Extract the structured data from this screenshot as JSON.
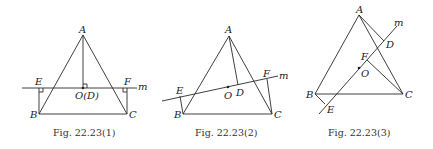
{
  "figures": [
    {
      "caption": "Fig.  22.23(1)",
      "labels": {
        "A": "A",
        "B": "B",
        "C": "C",
        "E": "E",
        "F": "F",
        "OD": "O(D)",
        "m": "m"
      }
    },
    {
      "caption": "Fig.  22.23(2)",
      "labels": {
        "A": "A",
        "B": "B",
        "C": "C",
        "D": "D",
        "E": "E",
        "F": "F",
        "O": "O",
        "m": "m"
      }
    },
    {
      "caption": "Fig.  22.23(3)",
      "labels": {
        "A": "A",
        "B": "B",
        "C": "C",
        "D": "D",
        "E": "E",
        "F": "F",
        "O": "O",
        "m": "m"
      }
    }
  ]
}
